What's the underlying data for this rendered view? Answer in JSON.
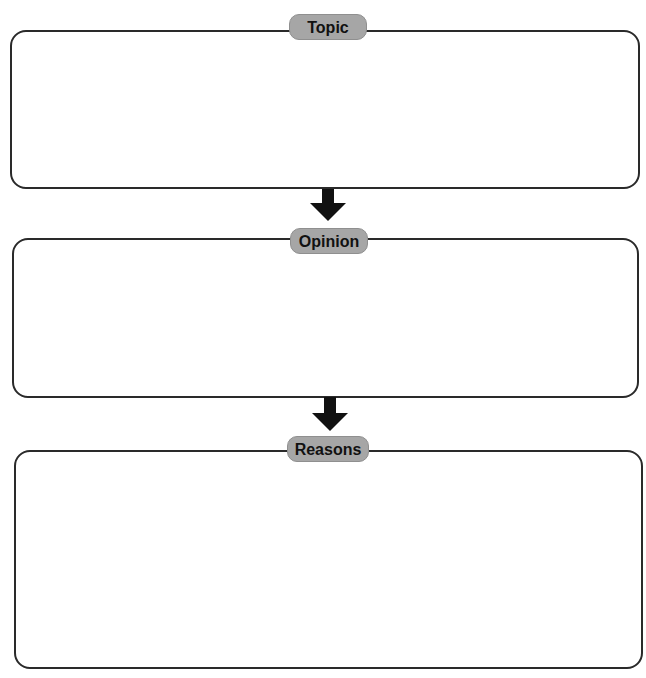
{
  "diagram": {
    "type": "flow-organizer",
    "sections": [
      {
        "label": "Topic",
        "content": ""
      },
      {
        "label": "Opinion",
        "content": ""
      },
      {
        "label": "Reasons",
        "content": ""
      }
    ],
    "colors": {
      "border": "#2a2a2a",
      "label_bg": "#a6a6a6",
      "arrow": "#111111"
    }
  }
}
